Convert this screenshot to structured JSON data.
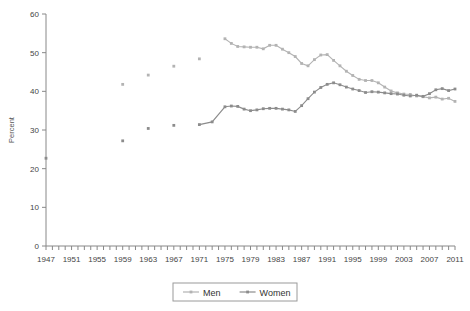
{
  "chart_data": {
    "type": "line",
    "title": "",
    "xlabel": "",
    "ylabel": "Percent",
    "xlim": [
      1947,
      2011
    ],
    "ylim": [
      0,
      60
    ],
    "yticks": [
      0,
      10,
      20,
      30,
      40,
      50,
      60
    ],
    "xticks_labeled": [
      1947,
      1951,
      1955,
      1959,
      1963,
      1967,
      1971,
      1975,
      1979,
      1983,
      1987,
      1991,
      1995,
      1999,
      2003,
      2007,
      2011
    ],
    "xtick_step_minor": 1,
    "grid": false,
    "legend_position": "bottom-center",
    "legend_border": true,
    "markers": true,
    "series": [
      {
        "name": "Men",
        "color": "#b3b3b3",
        "points": [
          {
            "x": 1959,
            "y": 41.8
          },
          {
            "x": 1963,
            "y": 44.2
          },
          {
            "x": 1967,
            "y": 46.5
          },
          {
            "x": 1971,
            "y": 48.4
          },
          {
            "x": 1975,
            "y": 53.6
          },
          {
            "x": 1976,
            "y": 52.4
          },
          {
            "x": 1977,
            "y": 51.6
          },
          {
            "x": 1978,
            "y": 51.5
          },
          {
            "x": 1979,
            "y": 51.4
          },
          {
            "x": 1980,
            "y": 51.4
          },
          {
            "x": 1981,
            "y": 51.0
          },
          {
            "x": 1982,
            "y": 51.9
          },
          {
            "x": 1983,
            "y": 51.9
          },
          {
            "x": 1984,
            "y": 50.9
          },
          {
            "x": 1985,
            "y": 50.0
          },
          {
            "x": 1986,
            "y": 49.0
          },
          {
            "x": 1987,
            "y": 47.2
          },
          {
            "x": 1988,
            "y": 46.6
          },
          {
            "x": 1989,
            "y": 48.2
          },
          {
            "x": 1990,
            "y": 49.4
          },
          {
            "x": 1991,
            "y": 49.5
          },
          {
            "x": 1992,
            "y": 48.0
          },
          {
            "x": 1993,
            "y": 46.6
          },
          {
            "x": 1994,
            "y": 45.2
          },
          {
            "x": 1995,
            "y": 44.1
          },
          {
            "x": 1996,
            "y": 43.1
          },
          {
            "x": 1997,
            "y": 42.8
          },
          {
            "x": 1998,
            "y": 42.8
          },
          {
            "x": 1999,
            "y": 42.2
          },
          {
            "x": 2000,
            "y": 41.1
          },
          {
            "x": 2001,
            "y": 40.1
          },
          {
            "x": 2002,
            "y": 39.6
          },
          {
            "x": 2003,
            "y": 39.3
          },
          {
            "x": 2004,
            "y": 39.2
          },
          {
            "x": 2005,
            "y": 38.8
          },
          {
            "x": 2006,
            "y": 38.6
          },
          {
            "x": 2007,
            "y": 38.3
          },
          {
            "x": 2008,
            "y": 38.5
          },
          {
            "x": 2009,
            "y": 38.0
          },
          {
            "x": 2010,
            "y": 38.2
          },
          {
            "x": 2011,
            "y": 37.4
          }
        ]
      },
      {
        "name": "Women",
        "color": "#8c8c8c",
        "points": [
          {
            "x": 1947,
            "y": 22.7
          },
          {
            "x": 1959,
            "y": 27.2
          },
          {
            "x": 1963,
            "y": 30.4
          },
          {
            "x": 1967,
            "y": 31.2
          },
          {
            "x": 1971,
            "y": 31.4
          },
          {
            "x": 1973,
            "y": 32.1
          },
          {
            "x": 1975,
            "y": 36.0
          },
          {
            "x": 1976,
            "y": 36.2
          },
          {
            "x": 1977,
            "y": 36.1
          },
          {
            "x": 1978,
            "y": 35.4
          },
          {
            "x": 1979,
            "y": 35.0
          },
          {
            "x": 1980,
            "y": 35.2
          },
          {
            "x": 1981,
            "y": 35.5
          },
          {
            "x": 1982,
            "y": 35.6
          },
          {
            "x": 1983,
            "y": 35.6
          },
          {
            "x": 1984,
            "y": 35.4
          },
          {
            "x": 1985,
            "y": 35.2
          },
          {
            "x": 1986,
            "y": 34.8
          },
          {
            "x": 1987,
            "y": 36.3
          },
          {
            "x": 1988,
            "y": 38.1
          },
          {
            "x": 1989,
            "y": 39.8
          },
          {
            "x": 1990,
            "y": 41.0
          },
          {
            "x": 1991,
            "y": 41.8
          },
          {
            "x": 1992,
            "y": 42.2
          },
          {
            "x": 1993,
            "y": 41.7
          },
          {
            "x": 1994,
            "y": 41.1
          },
          {
            "x": 1995,
            "y": 40.6
          },
          {
            "x": 1996,
            "y": 40.2
          },
          {
            "x": 1997,
            "y": 39.7
          },
          {
            "x": 1998,
            "y": 39.9
          },
          {
            "x": 1999,
            "y": 39.8
          },
          {
            "x": 2000,
            "y": 39.6
          },
          {
            "x": 2001,
            "y": 39.4
          },
          {
            "x": 2002,
            "y": 39.3
          },
          {
            "x": 2003,
            "y": 39.0
          },
          {
            "x": 2004,
            "y": 38.8
          },
          {
            "x": 2005,
            "y": 39.0
          },
          {
            "x": 2006,
            "y": 38.7
          },
          {
            "x": 2007,
            "y": 39.4
          },
          {
            "x": 2008,
            "y": 40.4
          },
          {
            "x": 2009,
            "y": 40.7
          },
          {
            "x": 2010,
            "y": 40.2
          },
          {
            "x": 2011,
            "y": 40.6
          }
        ]
      }
    ]
  },
  "legend": {
    "items": [
      {
        "label": "Men",
        "color": "#b3b3b3"
      },
      {
        "label": "Women",
        "color": "#8c8c8c"
      }
    ]
  },
  "axes": {
    "y_title": "Percent"
  }
}
